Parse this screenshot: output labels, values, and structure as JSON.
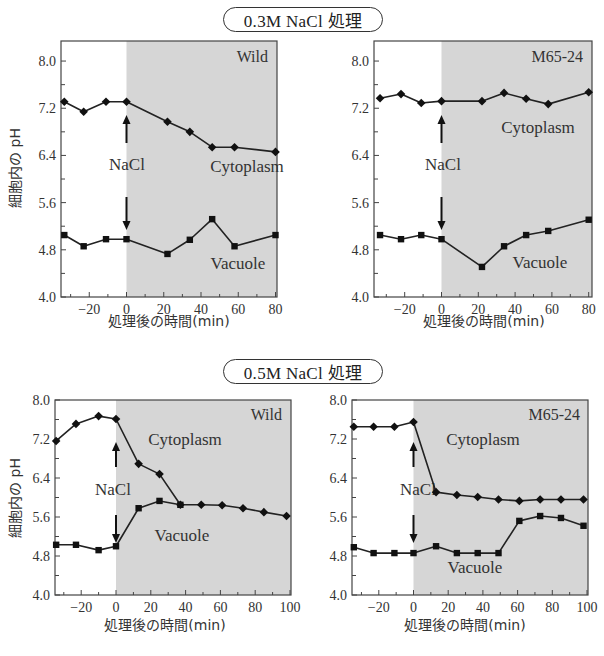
{
  "figure": {
    "section_titles": [
      "0.3M NaCl 処理",
      "0.5M NaCl 処理"
    ],
    "y_axis_label": "細胞内の pH",
    "x_axis_label": "処理後の時間(min)",
    "event_label": "NaCl",
    "colors": {
      "shade": "#d6d6d6",
      "line": "#222222",
      "frame": "#444444"
    }
  },
  "chart_data": [
    {
      "type": "line",
      "title": "Wild",
      "condition": "0.3M NaCl 処理",
      "xlabel": "処理後の時間(min)",
      "ylabel": "細胞内の pH",
      "xlim": [
        -34,
        80
      ],
      "ylim": [
        4.0,
        8.3
      ],
      "xticks": [
        -20,
        0,
        20,
        40,
        60,
        80
      ],
      "yticks": [
        4.0,
        4.8,
        5.6,
        6.4,
        7.2,
        8.0
      ],
      "shaded_region": [
        0,
        80
      ],
      "grid": false,
      "series": [
        {
          "name": "Cytoplasm",
          "marker": "diamond",
          "x": [
            -34,
            -23,
            -11,
            0,
            22,
            34,
            46,
            58,
            80
          ],
          "y": [
            7.31,
            7.14,
            7.31,
            7.31,
            6.97,
            6.8,
            6.54,
            6.54,
            6.46
          ]
        },
        {
          "name": "Vacuole",
          "marker": "square",
          "x": [
            -34,
            -23,
            -11,
            0,
            22,
            34,
            46,
            58,
            80
          ],
          "y": [
            5.05,
            4.86,
            4.98,
            4.98,
            4.73,
            4.97,
            5.32,
            4.86,
            5.05
          ]
        }
      ]
    },
    {
      "type": "line",
      "title": "M65-24",
      "condition": "0.3M NaCl 処理",
      "xlabel": "処理後の時間(min)",
      "ylabel": "",
      "xlim": [
        -34,
        80
      ],
      "ylim": [
        4.0,
        8.3
      ],
      "xticks": [
        -20,
        0,
        20,
        40,
        60,
        80
      ],
      "yticks": [
        4.0,
        4.8,
        5.6,
        6.4,
        7.2,
        8.0
      ],
      "shaded_region": [
        0,
        80
      ],
      "grid": false,
      "series": [
        {
          "name": "Cytoplasm",
          "marker": "diamond",
          "x": [
            -34,
            -22,
            -11,
            0,
            22,
            34,
            46,
            58,
            80
          ],
          "y": [
            7.37,
            7.44,
            7.29,
            7.32,
            7.32,
            7.46,
            7.36,
            7.27,
            7.47
          ]
        },
        {
          "name": "Vacuole",
          "marker": "square",
          "x": [
            -34,
            -22,
            -11,
            0,
            22,
            34,
            46,
            58,
            80
          ],
          "y": [
            5.05,
            4.98,
            5.05,
            4.98,
            4.51,
            4.86,
            5.05,
            5.12,
            5.31
          ]
        }
      ]
    },
    {
      "type": "line",
      "title": "Wild",
      "condition": "0.5M NaCl 処理",
      "xlabel": "処理後の時間(min)",
      "ylabel": "細胞内の pH",
      "xlim": [
        -35,
        100
      ],
      "ylim": [
        4.0,
        8.0
      ],
      "xticks": [
        -20,
        0,
        20,
        40,
        60,
        80,
        100
      ],
      "yticks": [
        4.0,
        4.8,
        5.6,
        6.4,
        7.2,
        8.0
      ],
      "shaded_region": [
        0,
        100
      ],
      "grid": false,
      "series": [
        {
          "name": "Cytoplasm",
          "marker": "diamond",
          "x": [
            -35,
            -23,
            -10,
            0,
            13,
            25,
            37,
            49,
            61,
            73,
            85,
            98
          ],
          "y": [
            7.16,
            7.51,
            7.67,
            7.61,
            6.69,
            6.48,
            5.85,
            5.85,
            5.84,
            5.78,
            5.7,
            5.62
          ]
        },
        {
          "name": "Vacuole",
          "marker": "square",
          "x": [
            -35,
            -23,
            -10,
            0,
            13,
            25,
            37
          ],
          "y": [
            5.03,
            5.03,
            4.92,
            5.0,
            5.78,
            5.93,
            5.85
          ]
        }
      ]
    },
    {
      "type": "line",
      "title": "M65-24",
      "condition": "0.5M NaCl 処理",
      "xlabel": "処理後の時間(min)",
      "ylabel": "",
      "xlim": [
        -35,
        100
      ],
      "ylim": [
        4.0,
        8.0
      ],
      "xticks": [
        -20,
        0,
        20,
        40,
        60,
        80,
        100
      ],
      "yticks": [
        4.0,
        4.8,
        5.6,
        6.4,
        7.2,
        8.0
      ],
      "shaded_region": [
        0,
        100
      ],
      "grid": false,
      "series": [
        {
          "name": "Cytoplasm",
          "marker": "diamond",
          "x": [
            -35,
            -23,
            -11,
            0,
            13,
            25,
            37,
            49,
            61,
            73,
            85,
            98
          ],
          "y": [
            7.45,
            7.45,
            7.45,
            7.55,
            6.11,
            6.05,
            6.01,
            5.96,
            5.93,
            5.96,
            5.96,
            5.96
          ]
        },
        {
          "name": "Vacuole",
          "marker": "square",
          "x": [
            -35,
            -23,
            -11,
            0,
            13,
            25,
            37,
            49,
            61,
            73,
            85,
            98
          ],
          "y": [
            4.98,
            4.86,
            4.86,
            4.86,
            5.0,
            4.86,
            4.86,
            4.86,
            5.52,
            5.62,
            5.58,
            5.42
          ]
        }
      ]
    }
  ]
}
